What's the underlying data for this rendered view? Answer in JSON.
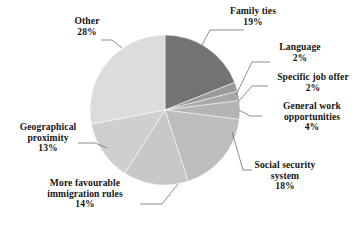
{
  "chart_data": {
    "type": "pie",
    "title": "",
    "subtitle": "",
    "xlabel": "",
    "ylabel": "",
    "legend_position": "none",
    "grid": false,
    "labels_outside": true,
    "value_unit": "%",
    "start_angle_deg": 0,
    "direction": "clockwise",
    "categories": [
      "Family ties",
      "Language",
      "Specific job offer",
      "General work opportunities",
      "Social security system",
      "More favourable immigration rules",
      "Geographical proximity",
      "Other"
    ],
    "values": [
      19,
      2,
      2,
      4,
      18,
      14,
      13,
      28
    ],
    "colors": [
      "#737373",
      "#9a9a9a",
      "#a8a8a8",
      "#b4b4b4",
      "#bdbdbd",
      "#c8c8c8",
      "#cfcfcf",
      "#dcdcdc"
    ],
    "slices": [
      {
        "label": "Family ties",
        "value": 19,
        "value_text": "19%",
        "color": "#737373"
      },
      {
        "label": "Language",
        "value": 2,
        "value_text": "2%",
        "color": "#9a9a9a"
      },
      {
        "label": "Specific job offer",
        "value": 2,
        "value_text": "2%",
        "color": "#a8a8a8"
      },
      {
        "label": "General work opportunities",
        "value": 4,
        "value_text": "4%",
        "color": "#b4b4b4"
      },
      {
        "label": "Social security system",
        "value": 18,
        "value_text": "18%",
        "color": "#bdbdbd"
      },
      {
        "label": "More favourable immigration rules",
        "value": 14,
        "value_text": "14%",
        "color": "#c8c8c8"
      },
      {
        "label": "Geographical proximity",
        "value": 13,
        "value_text": "13%",
        "color": "#cfcfcf"
      },
      {
        "label": "Other",
        "value": 28,
        "value_text": "28%",
        "color": "#dcdcdc"
      }
    ]
  },
  "labels": {
    "family_ties": {
      "line1": "Family ties",
      "value": "19%"
    },
    "language": {
      "line1": "Language",
      "value": "2%"
    },
    "specific_job_offer": {
      "line1": "Specific job offer",
      "value": "2%"
    },
    "general_work": {
      "line1": "General work",
      "line2": "opportunities",
      "value": "4%"
    },
    "social_security": {
      "line1": "Social security",
      "line2": "system",
      "value": "18%"
    },
    "immigration_rules": {
      "line1": "More favourable",
      "line2": "immigration rules",
      "value": "14%"
    },
    "geographical": {
      "line1": "Geographical",
      "line2": "proximity",
      "value": "13%"
    },
    "other": {
      "line1": "Other",
      "value": "28%"
    }
  },
  "style": {
    "background": "#ffffff",
    "text_color": "#151515",
    "leader_line_color": "#6f6f6f"
  }
}
